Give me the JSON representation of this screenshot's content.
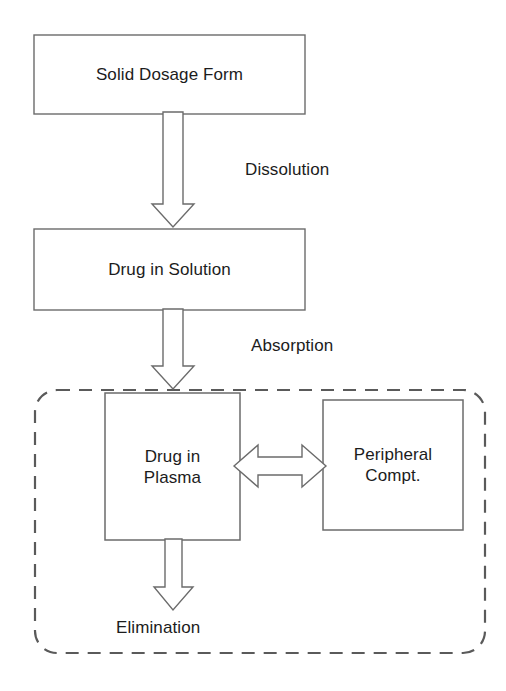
{
  "diagram": {
    "stroke_color": "#5a5a5a",
    "text_color": "#1c1c1c",
    "background_color": "#ffffff",
    "nodes": [
      {
        "id": "solid-dosage-form",
        "label": "Solid Dosage Form",
        "shape": "rectangle",
        "border": "solid",
        "x": 34,
        "y": 35,
        "width": 271,
        "height": 79
      },
      {
        "id": "drug-in-solution",
        "label": "Drug in Solution",
        "shape": "rectangle",
        "border": "solid",
        "x": 34,
        "y": 229,
        "width": 271,
        "height": 81
      },
      {
        "id": "drug-in-plasma",
        "label": "Drug in\nPlasma",
        "shape": "rectangle",
        "border": "solid",
        "x": 105,
        "y": 393,
        "width": 135,
        "height": 147
      },
      {
        "id": "peripheral-compartment",
        "label": "Peripheral\nCompt.",
        "shape": "rectangle",
        "border": "solid",
        "x": 323,
        "y": 400,
        "width": 140,
        "height": 130
      },
      {
        "id": "body-compartment-group",
        "label": "",
        "shape": "rounded-rectangle",
        "border": "dashed",
        "x": 35,
        "y": 390,
        "width": 450,
        "height": 263
      }
    ],
    "edges": [
      {
        "id": "dissolution",
        "label": "Dissolution",
        "from": "solid-dosage-form",
        "to": "drug-in-solution",
        "direction": "down",
        "style": "hollow-block-arrow",
        "label_x": 245,
        "label_y": 161
      },
      {
        "id": "absorption",
        "label": "Absorption",
        "from": "drug-in-solution",
        "to": "drug-in-plasma",
        "direction": "down",
        "style": "hollow-block-arrow",
        "label_x": 251,
        "label_y": 337
      },
      {
        "id": "distribution",
        "label": "",
        "from": "drug-in-plasma",
        "to": "peripheral-compartment",
        "direction": "bidirectional",
        "style": "hollow-block-double-arrow",
        "label_x": 0,
        "label_y": 0
      },
      {
        "id": "elimination",
        "label": "Elimination",
        "from": "drug-in-plasma",
        "to": "",
        "direction": "down",
        "style": "hollow-block-arrow",
        "label_x": 116,
        "label_y": 619
      }
    ]
  }
}
